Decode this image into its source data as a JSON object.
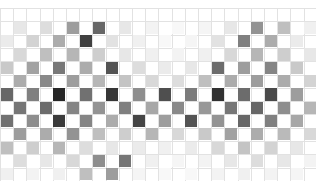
{
  "chart_data": {
    "type": "heatmap",
    "title": "",
    "subtitle": "",
    "xlabel": "",
    "ylabel": "",
    "grid": true,
    "legend": "none",
    "colormap": "grayscale",
    "pattern": "checkerboard",
    "ncols": 24,
    "nrows": 13,
    "cell_width": 13.2,
    "cell_height": 13.3,
    "origin_x": 0,
    "origin_y": 8,
    "xlim": [
      0,
      24
    ],
    "ylim": [
      0,
      13
    ],
    "value_range": [
      0.0,
      1.0
    ],
    "xticklabels": [],
    "yticklabels": [],
    "grid_color": "#e2e2e2",
    "background": "#ffffff",
    "values": [
      [
        0.0,
        0.0,
        0.0,
        0.0,
        0.0,
        0.0,
        0.0,
        0.0,
        0.0,
        0.0,
        0.0,
        0.0,
        0.0,
        0.0,
        0.0,
        0.0,
        0.0,
        0.0,
        0.0,
        0.0,
        0.0,
        0.0,
        0.0,
        0.0
      ],
      [
        0.0,
        0.1,
        0.0,
        0.14,
        0.0,
        0.4,
        0.0,
        0.62,
        0.0,
        0.1,
        0.0,
        0.05,
        0.0,
        0.03,
        0.0,
        0.04,
        0.0,
        0.1,
        0.0,
        0.44,
        0.0,
        0.26,
        0.0,
        0.06
      ],
      [
        0.08,
        0.0,
        0.18,
        0.0,
        0.34,
        0.0,
        0.78,
        0.0,
        0.12,
        0.0,
        0.06,
        0.0,
        0.03,
        0.0,
        0.04,
        0.0,
        0.12,
        0.0,
        0.52,
        0.0,
        0.34,
        0.0,
        0.08,
        0.0
      ],
      [
        0.0,
        0.16,
        0.0,
        0.26,
        0.0,
        0.3,
        0.0,
        0.2,
        0.0,
        0.1,
        0.0,
        0.06,
        0.0,
        0.05,
        0.0,
        0.06,
        0.0,
        0.16,
        0.0,
        0.3,
        0.0,
        0.2,
        0.0,
        0.1
      ],
      [
        0.22,
        0.0,
        0.38,
        0.0,
        0.55,
        0.0,
        0.34,
        0.0,
        0.7,
        0.0,
        0.14,
        0.0,
        0.08,
        0.0,
        0.1,
        0.0,
        0.6,
        0.0,
        0.4,
        0.0,
        0.5,
        0.0,
        0.22,
        0.0
      ],
      [
        0.0,
        0.34,
        0.0,
        0.48,
        0.0,
        0.4,
        0.0,
        0.3,
        0.0,
        0.24,
        0.0,
        0.16,
        0.0,
        0.14,
        0.0,
        0.26,
        0.0,
        0.34,
        0.0,
        0.4,
        0.0,
        0.34,
        0.0,
        0.18
      ],
      [
        0.62,
        0.0,
        0.52,
        0.0,
        0.88,
        0.0,
        0.58,
        0.0,
        0.82,
        0.0,
        0.46,
        0.0,
        0.72,
        0.0,
        0.54,
        0.0,
        0.84,
        0.0,
        0.6,
        0.0,
        0.74,
        0.0,
        0.4,
        0.0
      ],
      [
        0.0,
        0.56,
        0.0,
        0.6,
        0.0,
        0.5,
        0.0,
        0.44,
        0.0,
        0.52,
        0.0,
        0.36,
        0.0,
        0.48,
        0.0,
        0.42,
        0.0,
        0.56,
        0.0,
        0.62,
        0.0,
        0.46,
        0.0,
        0.3
      ],
      [
        0.58,
        0.0,
        0.46,
        0.0,
        0.8,
        0.0,
        0.5,
        0.0,
        0.34,
        0.0,
        0.76,
        0.0,
        0.4,
        0.0,
        0.7,
        0.0,
        0.44,
        0.0,
        0.62,
        0.0,
        0.52,
        0.0,
        0.36,
        0.0
      ],
      [
        0.0,
        0.4,
        0.0,
        0.34,
        0.0,
        0.44,
        0.0,
        0.26,
        0.0,
        0.2,
        0.0,
        0.3,
        0.0,
        0.16,
        0.0,
        0.22,
        0.0,
        0.38,
        0.0,
        0.34,
        0.0,
        0.28,
        0.0,
        0.16
      ],
      [
        0.26,
        0.0,
        0.2,
        0.0,
        0.3,
        0.0,
        0.14,
        0.0,
        0.1,
        0.0,
        0.08,
        0.0,
        0.06,
        0.0,
        0.08,
        0.0,
        0.16,
        0.0,
        0.24,
        0.0,
        0.18,
        0.0,
        0.1,
        0.0
      ],
      [
        0.0,
        0.14,
        0.0,
        0.1,
        0.0,
        0.16,
        0.0,
        0.46,
        0.0,
        0.56,
        0.0,
        0.06,
        0.0,
        0.04,
        0.0,
        0.05,
        0.0,
        0.1,
        0.0,
        0.14,
        0.0,
        0.1,
        0.0,
        0.05
      ],
      [
        0.06,
        0.0,
        0.05,
        0.0,
        0.06,
        0.0,
        0.26,
        0.0,
        0.4,
        0.0,
        0.04,
        0.0,
        0.03,
        0.0,
        0.03,
        0.0,
        0.05,
        0.0,
        0.06,
        0.0,
        0.05,
        0.0,
        0.04,
        0.0
      ]
    ]
  }
}
